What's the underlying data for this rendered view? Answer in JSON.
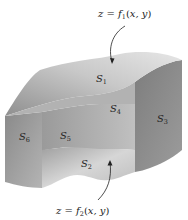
{
  "figure": {
    "top_equation": {
      "lhs": "z",
      "eq": " = ",
      "func": "f",
      "sub": "1",
      "args": "(x, y)"
    },
    "bottom_equation": {
      "lhs": "z",
      "eq": " = ",
      "func": "f",
      "sub": "2",
      "args": "(x, y)"
    },
    "faces": [
      {
        "id": "S1",
        "base": "S",
        "sub": "1",
        "position": "top"
      },
      {
        "id": "S4",
        "base": "S",
        "sub": "4",
        "position": "back-inner"
      },
      {
        "id": "S3",
        "base": "S",
        "sub": "3",
        "position": "right"
      },
      {
        "id": "S6",
        "base": "S",
        "sub": "6",
        "position": "left"
      },
      {
        "id": "S5",
        "base": "S",
        "sub": "5",
        "position": "front-inner"
      },
      {
        "id": "S2",
        "base": "S",
        "sub": "2",
        "position": "bottom"
      }
    ]
  },
  "colors": {
    "top_face_light": "#d9d9d9",
    "top_face_dark": "#9a9a9a",
    "side_face": "#8c8c8c",
    "inner_face": "#a8a8a8",
    "bottom_face": "#c4c4c4",
    "ink": "#222222"
  }
}
